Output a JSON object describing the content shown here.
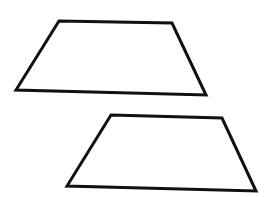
{
  "canvas": {
    "width": 269,
    "height": 197,
    "background": "#ffffff"
  },
  "stroke": {
    "color": "#111111",
    "width": 3
  },
  "shapes": [
    {
      "name": "trapezoid-top",
      "type": "trapezoid",
      "points": "59,21 172,23 206,95 16,90"
    },
    {
      "name": "trapezoid-bottom",
      "type": "trapezoid",
      "points": "111,115 222,118 256,191 67,186"
    }
  ]
}
